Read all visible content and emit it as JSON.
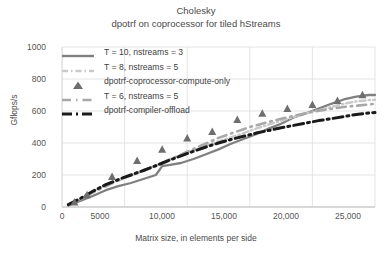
{
  "title": {
    "main": "Cholesky",
    "sub": "dpotrf on coprocessor for tiled hStreams"
  },
  "axes": {
    "ylabel": "Gflops/s",
    "xlabel": "Matrix size, in elements per side",
    "yticks": [
      "1000",
      "800",
      "600",
      "400",
      "200",
      "0"
    ],
    "xticks": [
      "0",
      "5000",
      "10,000",
      "15,000",
      "20,000",
      "25,000"
    ]
  },
  "colors": {
    "solid_gray": "#808080",
    "light_gray": "#c9c9c9",
    "mid_gray": "#a8a8a8",
    "black": "#1a1a1a",
    "marker": "#6e6e6e",
    "grid": "#dddddd",
    "text": "#3f3f3f"
  },
  "legend": [
    {
      "label": "T = 10, nstreams = 3",
      "key": "solid-line",
      "color": "#808080"
    },
    {
      "label": "T = 8, nstreams = 5",
      "key": "dashed-line-light",
      "color": "#c9c9c9"
    },
    {
      "label": "dpotrf-coprocessor-compute-only",
      "key": "triangle-marker",
      "color": "#6e6e6e"
    },
    {
      "label": "T = 6, nstreams = 5",
      "key": "dashed-line-mid",
      "color": "#a8a8a8"
    },
    {
      "label": "dpotrf-compiler-offload",
      "key": "dashed-line-black",
      "color": "#1a1a1a"
    }
  ],
  "chart_data": {
    "type": "line",
    "xlabel": "Matrix size, in elements per side",
    "ylabel": "Gflops/s",
    "xlim": [
      0,
      25000
    ],
    "ylim": [
      0,
      1000
    ],
    "xtick_values": [
      0,
      5000,
      10000,
      15000,
      20000,
      25000
    ],
    "ytick_values": [
      0,
      200,
      400,
      600,
      800,
      1000
    ],
    "grid": "both-light",
    "legend_position": "upper-left-inside",
    "series": [
      {
        "name": "T = 10, nstreams = 3",
        "style": "solid",
        "color": "#808080",
        "x": [
          500,
          1500,
          2500,
          3500,
          4500,
          5500,
          6500,
          7500,
          8000,
          8500,
          9500,
          10500,
          11500,
          12500,
          13500,
          14500,
          15500,
          16500,
          17500,
          18500,
          19500,
          20500,
          21500,
          22500,
          23500,
          24500,
          25000
        ],
        "y": [
          10,
          40,
          70,
          105,
          130,
          150,
          175,
          200,
          255,
          262,
          275,
          300,
          330,
          360,
          395,
          425,
          455,
          490,
          520,
          560,
          585,
          615,
          645,
          672,
          690,
          700,
          700
        ]
      },
      {
        "name": "T = 8, nstreams = 5",
        "style": "dashed",
        "color": "#c9c9c9",
        "x": [
          500,
          1500,
          2500,
          3500,
          4500,
          5500,
          6500,
          7500,
          8500,
          9500,
          10500,
          11500,
          12500,
          13500,
          14500,
          15500,
          16500,
          17500,
          18500,
          19500,
          20500,
          21500,
          22500,
          23500,
          24500,
          25000
        ],
        "y": [
          12,
          50,
          95,
          140,
          165,
          195,
          225,
          260,
          295,
          325,
          355,
          385,
          410,
          435,
          462,
          490,
          515,
          540,
          562,
          585,
          605,
          625,
          645,
          660,
          668,
          670
        ]
      },
      {
        "name": "T = 6, nstreams = 5",
        "style": "dashed",
        "color": "#a8a8a8",
        "x": [
          500,
          2500,
          5000,
          7500,
          10000,
          12500,
          15000,
          17500,
          20000,
          22500,
          25000
        ],
        "y": [
          12,
          92,
          185,
          258,
          345,
          432,
          500,
          552,
          595,
          625,
          645
        ]
      },
      {
        "name": "dpotrf-compiler-offload",
        "style": "dashed-thick",
        "color": "#1a1a1a",
        "x": [
          500,
          1500,
          2500,
          3500,
          4500,
          5500,
          6500,
          7500,
          8500,
          9500,
          10500,
          11500,
          12500,
          13500,
          14500,
          15500,
          16500,
          17500,
          18500,
          19500,
          20500,
          21500,
          22500,
          23500,
          24500,
          25000
        ],
        "y": [
          15,
          55,
          100,
          140,
          172,
          200,
          228,
          258,
          290,
          320,
          348,
          375,
          400,
          422,
          442,
          462,
          478,
          495,
          510,
          525,
          540,
          552,
          565,
          578,
          588,
          590
        ]
      },
      {
        "name": "dpotrf-coprocessor-compute-only",
        "style": "markers",
        "marker": "triangle",
        "color": "#6e6e6e",
        "x": [
          1000,
          2000,
          4000,
          6000,
          8000,
          10000,
          12000,
          14000,
          16000,
          18000,
          20000,
          22000,
          24000
        ],
        "y": [
          30,
          75,
          190,
          290,
          360,
          430,
          470,
          545,
          585,
          615,
          640,
          665,
          700
        ]
      }
    ]
  }
}
